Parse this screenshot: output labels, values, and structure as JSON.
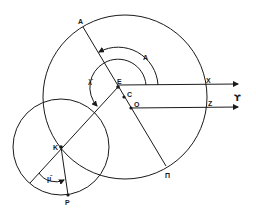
{
  "diagram": {
    "type": "geometric-construction",
    "labels": {
      "A_top": "A",
      "A_angle": "A",
      "lambda_bar": "λ̄",
      "E": "E",
      "C": "C",
      "O": "O",
      "X": "X",
      "Z": "Z",
      "Y": "ϒ",
      "K": "K",
      "mu_bar": "μ̄",
      "P": "P",
      "Pi": "Π"
    },
    "points": {
      "E": [
        118,
        87
      ],
      "C": [
        124,
        97
      ],
      "O": [
        131,
        108
      ],
      "K": [
        61,
        147
      ],
      "P": [
        68,
        195
      ]
    },
    "circles": [
      {
        "name": "deferent",
        "center": [
          125,
          97
        ],
        "r": 82
      },
      {
        "name": "epicycle",
        "center": [
          61,
          147
        ],
        "r": 48
      }
    ],
    "colors": {
      "ink": "#1a1a1a",
      "background": "#ffffff"
    }
  }
}
